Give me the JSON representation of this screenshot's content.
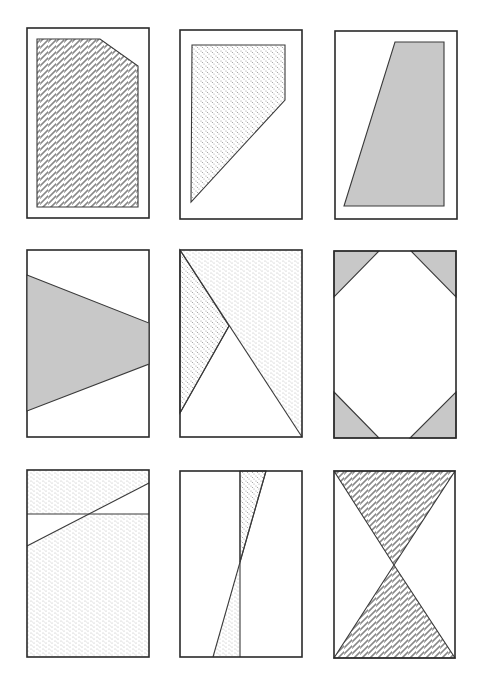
{
  "figure": {
    "layout": "3x3 grid of rectangular panels",
    "fills": {
      "solid_gray": "#c8c8c8",
      "zigzag_hatch": "#555555",
      "diagonal_dots": "#9a9a9a",
      "wavy_dots": "#b0b0b0",
      "outline": "#2a2a2a"
    },
    "panels": [
      {
        "id": 1,
        "row": 1,
        "col": 1,
        "shape": "pentagon (rectangle with clipped top-right corner)",
        "fill": "zigzag_hatch"
      },
      {
        "id": 2,
        "row": 1,
        "col": 2,
        "shape": "quadrilateral (top-left rectangle cut diagonally)",
        "fill": "diagonal_dots"
      },
      {
        "id": 3,
        "row": 1,
        "col": 3,
        "shape": "trapezoid leaning left",
        "fill": "solid_gray"
      },
      {
        "id": 4,
        "row": 2,
        "col": 1,
        "shape": "trapezoid wedge from left edge",
        "fill": "solid_gray"
      },
      {
        "id": 5,
        "row": 2,
        "col": 2,
        "shape": "diagonal split with inner triangle",
        "fill": "diagonal_dots + wavy_dots"
      },
      {
        "id": 6,
        "row": 2,
        "col": 3,
        "shape": "four corner triangles",
        "fill": "solid_gray"
      },
      {
        "id": 7,
        "row": 3,
        "col": 1,
        "shape": "horizontal line and diagonal line with unfilled sliver",
        "fill": "wavy_dots"
      },
      {
        "id": 8,
        "row": 3,
        "col": 2,
        "shape": "vertical line crossed by steep diagonal, two thin triangles",
        "fill": "diagonal_dots + wavy_dots"
      },
      {
        "id": 9,
        "row": 3,
        "col": 3,
        "shape": "hourglass (two triangles meeting at center)",
        "fill": "zigzag_hatch"
      }
    ]
  }
}
